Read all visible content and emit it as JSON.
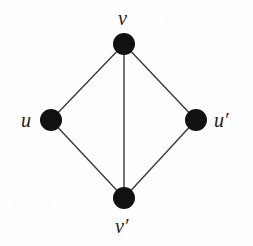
{
  "figure": {
    "background_color": "#fefefe",
    "width": 253,
    "height": 246
  },
  "graph": {
    "node_color": "#111111",
    "node_radius": 11,
    "edge_color": "#3a3a3a",
    "edge_width": 1.4,
    "nodes": [
      {
        "id": "v",
        "label": "v",
        "prime": false,
        "x": 124,
        "y": 44,
        "label_x": 118,
        "label_y": 8,
        "label_position": "above"
      },
      {
        "id": "u",
        "label": "u",
        "prime": false,
        "x": 51,
        "y": 120,
        "label_x": 21,
        "label_y": 110,
        "label_position": "left"
      },
      {
        "id": "u_prime",
        "label": "u",
        "prime": true,
        "x": 196,
        "y": 120,
        "label_x": 214,
        "label_y": 110,
        "label_position": "right"
      },
      {
        "id": "v_prime",
        "label": "v",
        "prime": true,
        "x": 124,
        "y": 198,
        "label_x": 115,
        "label_y": 216,
        "label_position": "below"
      }
    ],
    "edges": [
      {
        "id": "edge-v-u",
        "from": "v",
        "to": "u"
      },
      {
        "id": "edge-v-u-prime",
        "from": "v",
        "to": "u_prime"
      },
      {
        "id": "edge-u-v-prime",
        "from": "u",
        "to": "v_prime"
      },
      {
        "id": "edge-u-prime-v-prime",
        "from": "u_prime",
        "to": "v_prime"
      },
      {
        "id": "edge-v-v-prime",
        "from": "v",
        "to": "v_prime"
      }
    ]
  },
  "labels": {
    "top": "v",
    "left": "u",
    "right": "u′",
    "bottom": "v′"
  },
  "artifacts": {
    "a1": "f",
    "a2": "n",
    "a3": "t",
    "a4": "ll",
    "a5": "l"
  }
}
